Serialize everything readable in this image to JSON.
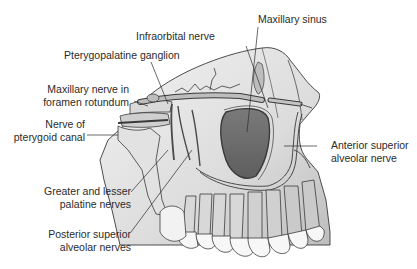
{
  "diagram": {
    "colors": {
      "background": "#ffffff",
      "bone_light": "#ececec",
      "bone_mid": "#cfcfcf",
      "bone_dark": "#9a9a9a",
      "sinus": "#6f6f6f",
      "outline": "#3a3a3a",
      "tooth": "#f7f7f7",
      "label_text": "#2b2b2b"
    },
    "labels": {
      "infraorbital_nerve": "Infraorbital nerve",
      "maxillary_sinus": "Maxillary sinus",
      "pterygopalatine_ganglion": "Pterygopalatine ganglion",
      "maxillary_nerve_line1": "Maxillary nerve in",
      "maxillary_nerve_line2": "foramen rotundum",
      "pterygoid_line1": "Nerve of",
      "pterygoid_line2": "pterygoid canal",
      "anterior_line1": "Anterior superior",
      "anterior_line2": "alveolar nerve",
      "palatine_line1": "Greater and lesser",
      "palatine_line2": "palatine nerves",
      "posterior_line1": "Posterior superior",
      "posterior_line2": "alveolar nerves"
    }
  }
}
